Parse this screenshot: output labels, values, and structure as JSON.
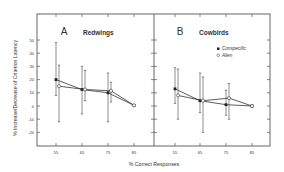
{
  "chart_data": {
    "type": "line",
    "ylabel": "% Increase/Decrease of Criterion Latency",
    "xlabel": "% Correct Responses",
    "ylim": [
      -30,
      60
    ],
    "yticks": [
      50,
      40,
      30,
      20,
      10,
      0,
      -10,
      -20
    ],
    "legend": {
      "position": "upper right of panel B",
      "entries": [
        "Conspecific",
        "Alien"
      ]
    },
    "panels": [
      {
        "letter": "A",
        "title": "Redwings",
        "categories": [
          "55",
          "65",
          "75",
          "85"
        ],
        "series": [
          {
            "name": "Conspecific",
            "marker": "filled",
            "values": [
              20,
              12.5,
              10,
              0.5
            ],
            "err_low": [
              8,
              -6,
              -12,
              0.5
            ],
            "err_high": [
              48,
              30,
              25,
              0.5
            ]
          },
          {
            "name": "Alien",
            "marker": "open",
            "values": [
              15,
              12.5,
              11.5,
              0.5
            ],
            "err_low": [
              -12,
              4,
              3,
              0.5
            ],
            "err_high": [
              31,
              27,
              18,
              0.5
            ]
          }
        ]
      },
      {
        "letter": "B",
        "title": "Cowbirds",
        "categories": [
          "55",
          "65",
          "75",
          "85"
        ],
        "series": [
          {
            "name": "Conspecific",
            "marker": "filled",
            "values": [
              13,
              4,
              1,
              0
            ],
            "err_low": [
              2,
              -5,
              -7,
              0
            ],
            "err_high": [
              29,
              25,
              12,
              0
            ]
          },
          {
            "name": "Alien",
            "marker": "open",
            "values": [
              8,
              4,
              6,
              0
            ],
            "err_low": [
              -10,
              -20,
              -10,
              0
            ],
            "err_high": [
              28,
              22,
              17,
              0
            ]
          }
        ]
      }
    ]
  }
}
